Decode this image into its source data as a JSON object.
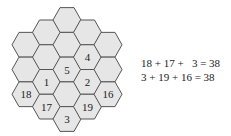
{
  "diagram": {
    "type": "hexagonal-magic-grid",
    "colors": {
      "cell_fill": "#e6e6e6",
      "cell_stroke": "#555555",
      "text": "#222222"
    },
    "columns": [
      {
        "cells": [
          "",
          "",
          "18"
        ]
      },
      {
        "cells": [
          "",
          "",
          "1",
          "17"
        ]
      },
      {
        "cells": [
          "",
          "",
          "5",
          "",
          "3"
        ]
      },
      {
        "cells": [
          "",
          "4",
          "2",
          "19"
        ]
      },
      {
        "cells": [
          "",
          "",
          "16"
        ]
      }
    ]
  },
  "equations": [
    "18 + 17 +   3 = 38",
    "3 + 19 + 16 = 38"
  ]
}
